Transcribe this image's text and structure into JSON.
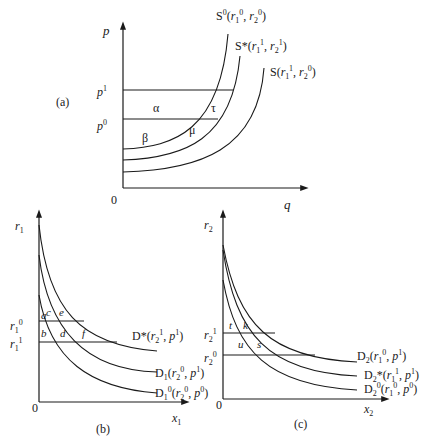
{
  "panel_a": {
    "label": "(a)",
    "y_axis": "p",
    "x_axis": "q",
    "origin": "0",
    "price_levels": [
      {
        "base": "p",
        "sup": "1"
      },
      {
        "base": "p",
        "sup": "0"
      }
    ],
    "areas": [
      "α",
      "τ",
      "β",
      "μ"
    ],
    "curves": [
      {
        "name": "S",
        "sup": "0",
        "args": "(r₁⁰, r₂⁰)"
      },
      {
        "name": "S*",
        "sup": "",
        "args": "(r₁¹, r₂¹)"
      },
      {
        "name": "S",
        "sup": "",
        "args": "(r₁¹, r₂⁰)"
      }
    ]
  },
  "panel_b": {
    "label": "(b)",
    "y_axis": "r₁",
    "x_axis": "x₁",
    "origin": "0",
    "levels": [
      "r₁⁰",
      "r₁¹"
    ],
    "areas": [
      "a",
      "c",
      "e",
      "b",
      "d",
      "f"
    ],
    "curves": [
      "D*(r₂¹, p¹)",
      "D₁(r₂⁰, p¹)",
      "D₁⁰(r₂⁰, p⁰)"
    ]
  },
  "panel_c": {
    "label": "(c)",
    "y_axis": "r₂",
    "x_axis": "x₂",
    "origin": "0",
    "levels": [
      "r₂¹",
      "r₂⁰"
    ],
    "areas": [
      "t",
      "k",
      "u",
      "s"
    ],
    "curves": [
      "D₂(r₁⁰, p¹)",
      "D₂*(r₁¹, p¹)",
      "D₂⁰(r₁⁰, p⁰)"
    ]
  }
}
